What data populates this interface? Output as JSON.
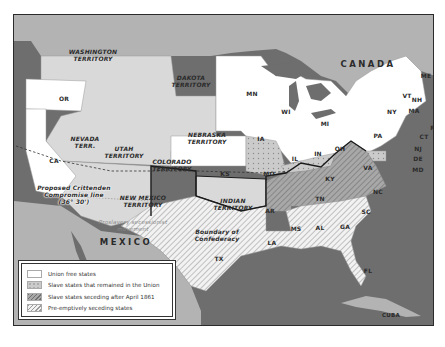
{
  "map": {
    "regions": {
      "canada": "CANADA",
      "mexico": "MEXICO",
      "cuba": "CUBA"
    },
    "territories": {
      "washington": "WASHINGTON\nTERRITORY",
      "dakota": "DAKOTA\nTERRITORY",
      "nebraska": "NEBRASKA\nTERRITORY",
      "nevada": "NEVADA\nTERR.",
      "utah": "UTAH\nTERRITORY",
      "colorado": "COLORADO\nTERRITORY",
      "new_mexico": "NEW MEXICO\nTERRITORY",
      "indian": "INDIAN\nTERRITORY"
    },
    "states": {
      "or": "OR",
      "ca": "CA",
      "mn": "MN",
      "wi": "WI",
      "mi": "MI",
      "ia": "IA",
      "ks": "KS",
      "mo": "MO",
      "il": "IL",
      "in": "IN",
      "oh": "OH",
      "ky": "KY",
      "pa": "PA",
      "ny": "NY",
      "vt": "VT",
      "nh": "NH",
      "me": "ME",
      "ma": "MA",
      "ri": "RI",
      "ct": "CT",
      "nj": "NJ",
      "de": "DE",
      "md": "MD",
      "va": "VA",
      "nc": "NC",
      "tn": "TN",
      "ar": "AR",
      "sc": "SC",
      "ga": "GA",
      "al": "AL",
      "ms": "MS",
      "la": "LA",
      "tx": "TX",
      "fl": "FL"
    },
    "annotations": {
      "crittenden": "Proposed Crittenden\nCompromise line\n(36° 30')",
      "proslavery": "Proslavery secessionist\nmovement",
      "boundary": "Boundary of\nConfederacy"
    },
    "colors": {
      "water": "#6e6e6e",
      "foreign_land": "#b3b3b3",
      "territory": "#d9d9d9",
      "union_free": "#ffffff",
      "slave_union": "#c8c8c8",
      "seceding_after": "#9a9a9a",
      "preemptive": "#ececec",
      "border": "#1a1a1a"
    }
  },
  "legend": {
    "items": [
      {
        "label": "Union free states",
        "key": "union_free"
      },
      {
        "label": "Slave states that remained in the Union",
        "key": "slave_union"
      },
      {
        "label": "Slave states seceding after April 1861",
        "key": "seceding_after"
      },
      {
        "label": "Pre-emptively seceding states",
        "key": "preemptive"
      }
    ]
  }
}
